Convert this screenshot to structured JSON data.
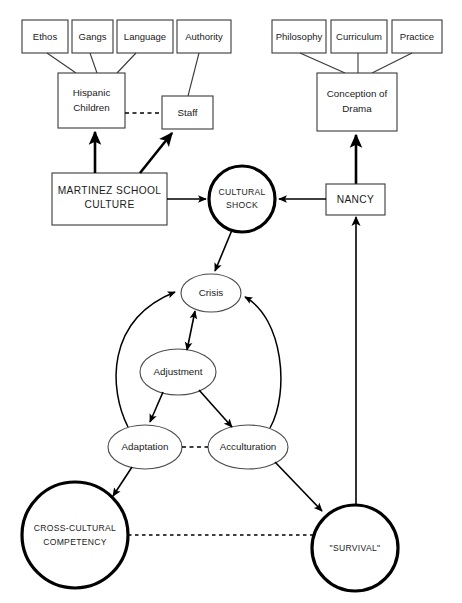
{
  "diagram": {
    "colors": {
      "background": "#ffffff",
      "box_stroke": "#3a3a3a",
      "ellipse_stroke": "#4a4a4a",
      "heavy_stroke": "#000000",
      "text": "#1a1a1a"
    },
    "nodes": {
      "ethos": {
        "label": "Ethos",
        "shape": "rect"
      },
      "gangs": {
        "label": "Gangs",
        "shape": "rect"
      },
      "language": {
        "label": "Language",
        "shape": "rect"
      },
      "authority": {
        "label": "Authority",
        "shape": "rect"
      },
      "hispanic_children": {
        "label_line1": "Hispanic",
        "label_line2": "Children",
        "shape": "rect"
      },
      "staff": {
        "label": "Staff",
        "shape": "rect"
      },
      "martinez": {
        "label_line1": "MARTINEZ  SCHOOL",
        "label_line2": "CULTURE",
        "shape": "rect"
      },
      "cultural_shock": {
        "label_line1": "CULTURAL",
        "label_line2": "SHOCK",
        "shape": "circle-heavy"
      },
      "nancy": {
        "label": "NANCY",
        "shape": "rect"
      },
      "philosophy": {
        "label": "Philosophy",
        "shape": "rect"
      },
      "curriculum": {
        "label": "Curriculum",
        "shape": "rect"
      },
      "practice": {
        "label": "Practice",
        "shape": "rect"
      },
      "conception_of_drama": {
        "label_line1": "Conception of",
        "label_line2": "Drama",
        "shape": "rect"
      },
      "crisis": {
        "label": "Crisis",
        "shape": "ellipse"
      },
      "adjustment": {
        "label": "Adjustment",
        "shape": "ellipse"
      },
      "adaptation": {
        "label": "Adaptation",
        "shape": "ellipse"
      },
      "acculturation": {
        "label": "Acculturation",
        "shape": "ellipse"
      },
      "cross_cultural_competency": {
        "label_line1": "CROSS-CULTURAL",
        "label_line2": "COMPETENCY",
        "shape": "circle-heavy"
      },
      "survival": {
        "label": "\"SURVIVAL\"",
        "shape": "circle-heavy"
      }
    },
    "edges": [
      {
        "from": "ethos",
        "to": "hispanic_children",
        "style": "plain"
      },
      {
        "from": "gangs",
        "to": "hispanic_children",
        "style": "plain"
      },
      {
        "from": "language",
        "to": "hispanic_children",
        "style": "plain"
      },
      {
        "from": "authority",
        "to": "staff",
        "style": "plain"
      },
      {
        "from": "hispanic_children",
        "to": "staff",
        "style": "dashed"
      },
      {
        "from": "martinez",
        "to": "hispanic_children",
        "style": "arrow"
      },
      {
        "from": "martinez",
        "to": "staff",
        "style": "arrow"
      },
      {
        "from": "martinez",
        "to": "cultural_shock",
        "style": "arrow"
      },
      {
        "from": "nancy",
        "to": "cultural_shock",
        "style": "arrow"
      },
      {
        "from": "philosophy",
        "to": "conception_of_drama",
        "style": "plain"
      },
      {
        "from": "curriculum",
        "to": "conception_of_drama",
        "style": "plain"
      },
      {
        "from": "practice",
        "to": "conception_of_drama",
        "style": "plain"
      },
      {
        "from": "nancy",
        "to": "conception_of_drama",
        "style": "arrow"
      },
      {
        "from": "cultural_shock",
        "to": "crisis",
        "style": "arrow"
      },
      {
        "from": "crisis",
        "to": "adjustment",
        "style": "arrow-double"
      },
      {
        "from": "adjustment",
        "to": "adaptation",
        "style": "arrow"
      },
      {
        "from": "adjustment",
        "to": "acculturation",
        "style": "arrow"
      },
      {
        "from": "adaptation",
        "to": "crisis",
        "style": "arrow-curve"
      },
      {
        "from": "acculturation",
        "to": "crisis",
        "style": "arrow-curve"
      },
      {
        "from": "adaptation",
        "to": "acculturation",
        "style": "dashed"
      },
      {
        "from": "adaptation",
        "to": "cross_cultural_competency",
        "style": "arrow"
      },
      {
        "from": "acculturation",
        "to": "survival",
        "style": "arrow"
      },
      {
        "from": "cross_cultural_competency",
        "to": "survival",
        "style": "dashed"
      },
      {
        "from": "survival",
        "to": "nancy",
        "style": "arrow"
      }
    ]
  }
}
